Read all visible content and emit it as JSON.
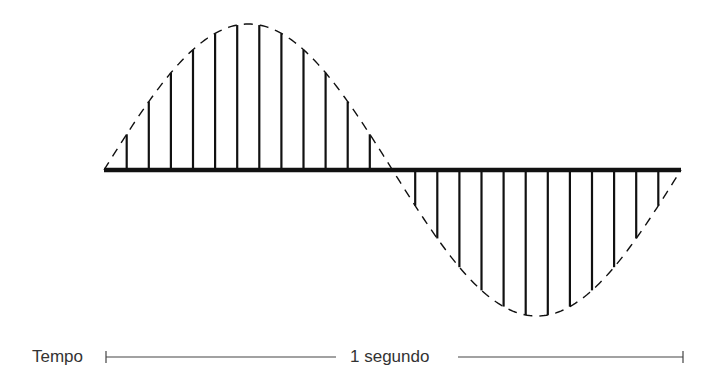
{
  "figure": {
    "time_label": "Tempo",
    "duration_label": "1 segundo",
    "colors": {
      "stroke": "#111111",
      "scale_bar": "#444444",
      "text": "#333333",
      "background": "#ffffff"
    }
  },
  "waveform": {
    "type": "sine",
    "cycles": 1,
    "x_start": 104,
    "x_end": 681,
    "baseline_y": 170,
    "amplitude": 146,
    "sample_lines_positive": 12,
    "sample_lines_negative": 12,
    "sample_spacing": 22.1,
    "envelope_style": "dashed"
  },
  "scale_bar": {
    "x_start": 106,
    "x_end": 683,
    "y": 357
  }
}
